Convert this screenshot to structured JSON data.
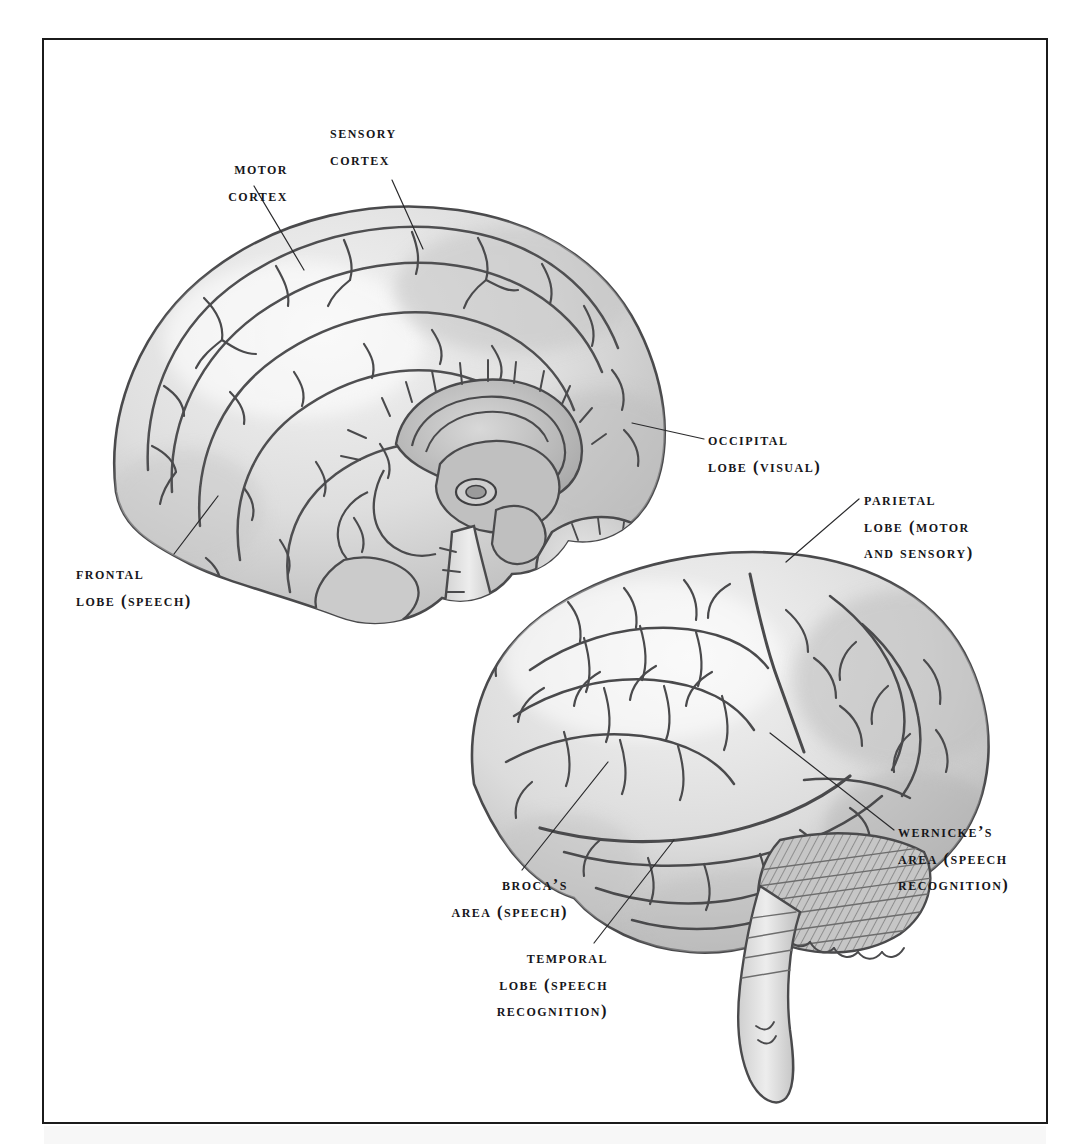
{
  "page": {
    "type": "anatomical-illustration",
    "background_color": "#ffffff",
    "frame_color": "#1b1b1b",
    "ink_color": "#3a3a3c",
    "shade_light": "#e8e8e8",
    "shade_mid": "#cfcfcf",
    "shade_dark": "#a9a9a9",
    "text_color": "#16161a"
  },
  "labels": [
    {
      "id": "motor-cortex",
      "text": "Motor\ncortex",
      "align": "right",
      "x": 168,
      "y": 156,
      "width": 120
    },
    {
      "id": "sensory-cortex",
      "text": "Sensory\ncortex",
      "align": "left",
      "x": 330,
      "y": 120,
      "width": 140
    },
    {
      "id": "occipital-lobe",
      "text": "Occipital\nlobe (visual)",
      "align": "left",
      "x": 708,
      "y": 427,
      "width": 200
    },
    {
      "id": "parietal-lobe",
      "text": "Parietal\nlobe (motor\nand sensory)",
      "align": "left",
      "x": 864,
      "y": 487,
      "width": 190
    },
    {
      "id": "frontal-lobe",
      "text": "Frontal\nlobe (speech)",
      "align": "left",
      "x": 76,
      "y": 561,
      "width": 190
    },
    {
      "id": "wernickes-area",
      "text": "Wernicke’s\narea (speech\nrecognition)",
      "align": "left",
      "x": 898,
      "y": 819,
      "width": 180
    },
    {
      "id": "brocas-area",
      "text": "Broca’s\narea (speech)",
      "align": "right",
      "x": 398,
      "y": 872,
      "width": 170
    },
    {
      "id": "temporal-lobe",
      "text": "Temporal\nlobe (speech\nrecognition)",
      "align": "right",
      "x": 420,
      "y": 945,
      "width": 188
    }
  ],
  "leader_lines": [
    {
      "id": "leader-motor-cortex",
      "x1": 252,
      "y1": 184,
      "x2": 302,
      "y2": 268
    },
    {
      "id": "leader-sensory-cortex",
      "x1": 390,
      "y1": 178,
      "x2": 421,
      "y2": 247
    },
    {
      "id": "leader-occipital-lobe",
      "x1": 702,
      "y1": 437,
      "x2": 630,
      "y2": 421
    },
    {
      "id": "leader-parietal-lobe",
      "x1": 857,
      "y1": 497,
      "x2": 784,
      "y2": 560
    },
    {
      "id": "leader-frontal-lobe",
      "x1": 172,
      "y1": 552,
      "x2": 216,
      "y2": 494
    },
    {
      "id": "leader-wernickes-area",
      "x1": 892,
      "y1": 828,
      "x2": 768,
      "y2": 731
    },
    {
      "id": "leader-brocas-area",
      "x1": 520,
      "y1": 868,
      "x2": 606,
      "y2": 760
    },
    {
      "id": "leader-temporal-lobe",
      "x1": 592,
      "y1": 941,
      "x2": 672,
      "y2": 838
    }
  ],
  "figure_parts": [
    {
      "id": "sagittal-view",
      "name": "Midsagittal brain section (upper left)"
    },
    {
      "id": "corpus-callosum",
      "name": "Corpus callosum"
    },
    {
      "id": "thalamus",
      "name": "Thalamus and diencephalon"
    },
    {
      "id": "brainstem-upper",
      "name": "Brainstem (sagittal)"
    },
    {
      "id": "cerebellum-upper",
      "name": "Cerebellum (sagittal, arbor vitae)"
    },
    {
      "id": "lateral-view",
      "name": "Lateral brain view (lower right)"
    },
    {
      "id": "cerebellum-lower",
      "name": "Cerebellum (lateral, hatched)"
    },
    {
      "id": "brainstem-lower",
      "name": "Brainstem / spinal cord (lateral)"
    }
  ]
}
